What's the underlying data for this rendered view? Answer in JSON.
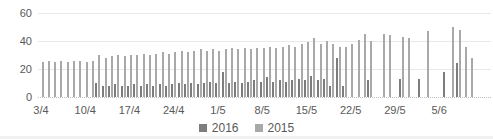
{
  "chart_data": {
    "type": "bar",
    "title": "",
    "xlabel": "",
    "ylabel": "",
    "ylim": [
      0,
      60
    ],
    "yticks": [
      0,
      20,
      40,
      60
    ],
    "grid": "horizontal",
    "legend_position": "bottom",
    "xtick_labels": [
      "3/4",
      "10/4",
      "17/4",
      "24/4",
      "1/5",
      "8/5",
      "15/5",
      "22/5",
      "29/5",
      "5/6"
    ],
    "xtick_interval_days": 7,
    "x": [
      "3/4",
      "4/4",
      "5/4",
      "6/4",
      "7/4",
      "8/4",
      "9/4",
      "10/4",
      "11/4",
      "12/4",
      "13/4",
      "14/4",
      "15/4",
      "16/4",
      "17/4",
      "18/4",
      "19/4",
      "20/4",
      "21/4",
      "22/4",
      "23/4",
      "24/4",
      "25/4",
      "26/4",
      "27/4",
      "28/4",
      "29/4",
      "30/4",
      "1/5",
      "2/5",
      "3/5",
      "4/5",
      "5/5",
      "6/5",
      "7/5",
      "8/5",
      "9/5",
      "10/5",
      "11/5",
      "12/5",
      "13/5",
      "14/5",
      "15/5",
      "16/5",
      "17/5",
      "18/5",
      "19/5",
      "20/5",
      "21/5",
      "22/5",
      "23/5",
      "24/5",
      "25/5",
      "26/5",
      "27/5",
      "28/5",
      "29/5",
      "30/5",
      "31/5",
      "1/6",
      "2/6",
      "3/6",
      "4/6",
      "5/6",
      "6/6",
      "7/6",
      "8/6",
      "9/6",
      "10/6"
    ],
    "series": [
      {
        "name": "2016",
        "color": "#7d7d7d",
        "values": [
          null,
          null,
          null,
          null,
          null,
          null,
          null,
          null,
          null,
          10,
          8,
          8,
          9,
          8,
          8,
          9,
          8,
          9,
          8,
          9,
          8,
          9,
          10,
          9,
          10,
          9,
          10,
          11,
          10,
          18,
          10,
          11,
          10,
          11,
          12,
          11,
          14,
          11,
          12,
          11,
          12,
          13,
          12,
          15,
          12,
          13,
          8,
          28,
          8,
          null,
          null,
          null,
          12,
          null,
          null,
          null,
          null,
          13,
          null,
          null,
          13,
          null,
          null,
          null,
          18,
          null,
          24,
          null,
          null
        ]
      },
      {
        "name": "2015",
        "color": "#a9a9a9",
        "values": [
          25,
          26,
          25,
          26,
          25,
          26,
          26,
          25,
          26,
          30,
          28,
          29,
          30,
          29,
          30,
          30,
          31,
          30,
          31,
          32,
          31,
          32,
          33,
          32,
          33,
          34,
          33,
          34,
          33,
          34,
          35,
          34,
          35,
          34,
          35,
          35,
          36,
          35,
          36,
          37,
          36,
          38,
          39,
          42,
          38,
          40,
          38,
          36,
          36,
          38,
          41,
          45,
          40,
          null,
          45,
          44,
          null,
          43,
          42,
          null,
          null,
          47,
          null,
          null,
          null,
          50,
          48,
          36,
          28
        ]
      }
    ]
  },
  "colors": {
    "background": "#ffffff",
    "gridline": "#e8e8e8",
    "axis_line": "#bfbfbf",
    "tick_text": "#595959",
    "legend_text": "#595959",
    "bottom_edge": "#f1f1f1"
  }
}
